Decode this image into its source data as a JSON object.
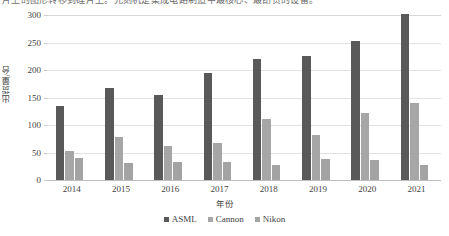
{
  "page": {
    "top_clipped_text": "片上的图形转移到硅片上。光刻机是集成电路制造中最核心、最昂贵的设备。"
  },
  "chart_data": {
    "type": "bar",
    "title": "",
    "subtitle": "",
    "xlabel": "年份",
    "ylabel": "出货量/台",
    "categories": [
      "2014",
      "2015",
      "2016",
      "2017",
      "2018",
      "2019",
      "2020",
      "2021"
    ],
    "series": [
      {
        "name": "ASML",
        "color": "#595959",
        "values": [
          135,
          167,
          155,
          195,
          220,
          226,
          252,
          301
        ]
      },
      {
        "name": "Cannon",
        "color": "#a6a6a6",
        "values": [
          52,
          78,
          62,
          67,
          111,
          81,
          121,
          140
        ]
      },
      {
        "name": "Nikon",
        "color": "#a3a3a3",
        "values": [
          40,
          31,
          33,
          33,
          27,
          39,
          36,
          27
        ]
      }
    ],
    "ylim": [
      0,
      300
    ],
    "yticks": [
      0,
      50,
      100,
      150,
      200,
      250,
      300
    ],
    "ytick_labels": [
      "0",
      "50",
      "100",
      "150",
      "200",
      "250",
      "300"
    ],
    "grid": true,
    "grid_axis": "y",
    "legend_position": "bottom",
    "legend_entries": [
      "ASML",
      "Cannon",
      "Nikon"
    ]
  }
}
